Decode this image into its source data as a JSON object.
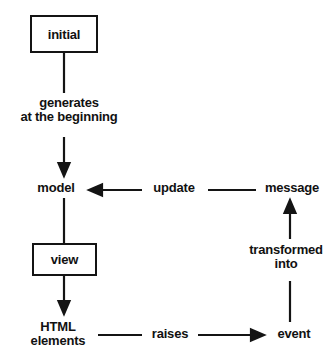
{
  "diagram": {
    "background_color": "#ffffff",
    "stroke_color": "#141414",
    "text_color": "#111111",
    "nodes": [
      {
        "id": "initial",
        "label": "initial",
        "shape": "box"
      },
      {
        "id": "model",
        "label": "model",
        "shape": "text"
      },
      {
        "id": "view",
        "label": "view",
        "shape": "box"
      },
      {
        "id": "html_elements",
        "label": "HTML\nelements",
        "shape": "text"
      },
      {
        "id": "event",
        "label": "event",
        "shape": "text"
      },
      {
        "id": "message",
        "label": "message",
        "shape": "text"
      }
    ],
    "edges": [
      {
        "id": "initial-to-model",
        "from": "initial",
        "to": "model",
        "label": "generates\nat the beginning",
        "arrow": true,
        "direction": "down"
      },
      {
        "id": "model-to-view",
        "from": "model",
        "to": "view",
        "label": "",
        "arrow": false,
        "direction": "down"
      },
      {
        "id": "view-to-html",
        "from": "view",
        "to": "html_elements",
        "label": "",
        "arrow": true,
        "direction": "down"
      },
      {
        "id": "html-to-event",
        "from": "html_elements",
        "to": "event",
        "label": "raises",
        "arrow": true,
        "direction": "right"
      },
      {
        "id": "event-to-message",
        "from": "event",
        "to": "message",
        "label": "transformed\ninto",
        "arrow": true,
        "direction": "up"
      },
      {
        "id": "message-to-model",
        "from": "message",
        "to": "model",
        "label": "update",
        "arrow": true,
        "direction": "left"
      }
    ]
  }
}
